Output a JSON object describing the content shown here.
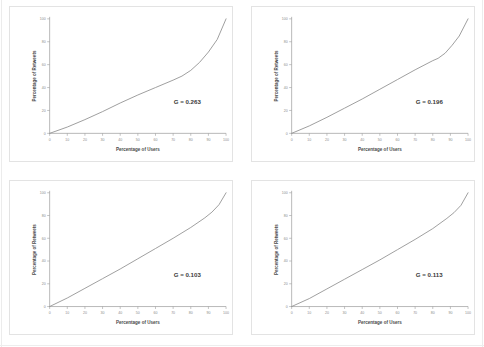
{
  "figure": {
    "panel_count": 4,
    "background_color": "#ffffff",
    "curve_color": "#8d8d8d",
    "axis_color": "#9a9a9a",
    "label_color": "#4a4a4a"
  },
  "chart_data": [
    {
      "type": "line",
      "title": "",
      "xlabel": "Percentage of Users",
      "ylabel": "Percentage of Retweets",
      "xlim": [
        0,
        100
      ],
      "ylim": [
        0,
        100
      ],
      "xticks": [
        0,
        10,
        20,
        30,
        40,
        50,
        60,
        70,
        80,
        90,
        100
      ],
      "yticks": [
        0,
        20,
        40,
        60,
        80,
        100
      ],
      "grid": false,
      "legend": "none",
      "annotation": "G = 0.263",
      "gini": 0.263,
      "series": [
        {
          "name": "Lorenz curve",
          "x": [
            0,
            10,
            20,
            30,
            40,
            50,
            60,
            70,
            75,
            80,
            85,
            90,
            95,
            100
          ],
          "values": [
            0,
            5.5,
            12,
            19,
            26.5,
            33.5,
            40,
            46.5,
            50,
            55,
            62,
            71,
            82,
            100
          ]
        }
      ]
    },
    {
      "type": "line",
      "title": "",
      "xlabel": "Percentage of Users",
      "ylabel": "Percentage of Retweets",
      "xlim": [
        0,
        100
      ],
      "ylim": [
        0,
        100
      ],
      "xticks": [
        0,
        10,
        20,
        30,
        40,
        50,
        60,
        70,
        80,
        90,
        100
      ],
      "yticks": [
        0,
        20,
        40,
        60,
        80,
        100
      ],
      "grid": false,
      "legend": "none",
      "annotation": "G = 0.196",
      "gini": 0.196,
      "series": [
        {
          "name": "Lorenz curve",
          "x": [
            0,
            10,
            20,
            30,
            40,
            50,
            60,
            70,
            80,
            83,
            87,
            91,
            95,
            100
          ],
          "values": [
            0,
            6.5,
            14,
            22,
            30,
            38.5,
            47,
            55.5,
            63.5,
            65.5,
            70,
            77,
            85,
            100
          ]
        }
      ]
    },
    {
      "type": "line",
      "title": "",
      "xlabel": "Percentage of Users",
      "ylabel": "Percentage of Retweets",
      "xlim": [
        0,
        100
      ],
      "ylim": [
        0,
        100
      ],
      "xticks": [
        0,
        10,
        20,
        30,
        40,
        50,
        60,
        70,
        80,
        90,
        100
      ],
      "yticks": [
        0,
        20,
        40,
        60,
        80,
        100
      ],
      "grid": false,
      "legend": "none",
      "annotation": "G = 0.103",
      "gini": 0.103,
      "series": [
        {
          "name": "Lorenz curve",
          "x": [
            0,
            10,
            20,
            30,
            40,
            50,
            60,
            70,
            80,
            88,
            92,
            96,
            100
          ],
          "values": [
            0,
            7.5,
            16,
            24.5,
            33,
            42,
            51,
            60,
            69.5,
            78,
            83,
            89.5,
            100
          ]
        }
      ]
    },
    {
      "type": "line",
      "title": "",
      "xlabel": "Percentage of Users",
      "ylabel": "Percentage of Retweets",
      "xlim": [
        0,
        100
      ],
      "ylim": [
        0,
        100
      ],
      "xticks": [
        0,
        10,
        20,
        30,
        40,
        50,
        60,
        70,
        80,
        90,
        100
      ],
      "yticks": [
        0,
        20,
        40,
        60,
        80,
        100
      ],
      "grid": false,
      "legend": "none",
      "annotation": "G = 0.113",
      "gini": 0.113,
      "series": [
        {
          "name": "Lorenz curve",
          "x": [
            0,
            10,
            20,
            30,
            40,
            50,
            60,
            70,
            80,
            88,
            92,
            96,
            100
          ],
          "values": [
            0,
            7,
            15.5,
            24,
            32.5,
            41,
            50,
            59,
            68.5,
            77.5,
            82.5,
            89,
            100
          ]
        }
      ]
    }
  ]
}
